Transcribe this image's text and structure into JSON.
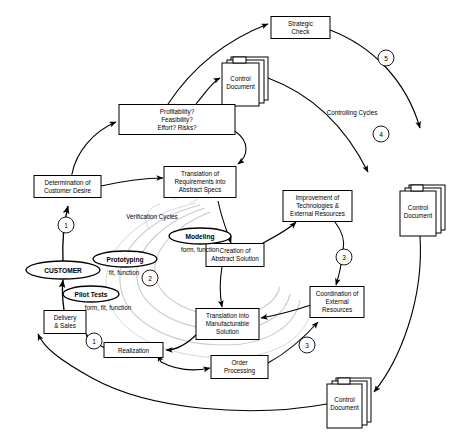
{
  "diagram": {
    "nodes": {
      "strategic_check": {
        "line1": "Strategic",
        "line2": "Check"
      },
      "control_document_top": {
        "line1": "Control",
        "line2": "Document"
      },
      "control_document_right": {
        "line1": "Control",
        "line2": "Document"
      },
      "control_document_bottom": {
        "line1": "Control",
        "line2": "Document"
      },
      "profitability": {
        "line1": "Profitability?",
        "line2": "Feasibility?",
        "line3": "Effort? Risks?"
      },
      "determination": {
        "line1": "Determination of",
        "line2": "Customer Desire"
      },
      "translation_requirements": {
        "line1": "Translation of",
        "line2": "Requirements into",
        "line3": "Abstract Specs"
      },
      "improvement": {
        "line1": "Improvement of",
        "line2": "Technologies &",
        "line3": "External Resources"
      },
      "creation_abstract": {
        "line1": "Creation of",
        "line2": "Abstract Solution"
      },
      "coordination": {
        "line1": "Coordination of",
        "line2": "External",
        "line3": "Resources"
      },
      "translation_manufacturable": {
        "line1": "Translation into",
        "line2": "Manufacturable",
        "line3": "Solution"
      },
      "order_processing": {
        "line1": "Order",
        "line2": "Processing"
      },
      "realization": {
        "line1": "Realization"
      },
      "delivery_sales": {
        "line1": "Delivery",
        "line2": "& Sales"
      },
      "customer": {
        "label": "CUSTOMER"
      },
      "modeling": {
        "label": "Modeling",
        "sub": "form, function"
      },
      "prototyping": {
        "label": "Prototyping",
        "sub": "fit, function"
      },
      "pilot_tests": {
        "label": "Pilot Tests",
        "sub": "form, fit, function"
      }
    },
    "labels": {
      "verification_cycles": "Verification Cycles",
      "controlling_cycles": "Controlling Cycles"
    },
    "cycle_markers": {
      "m1_top": "1",
      "m1_bottom": "1",
      "m2": "2",
      "m3_upper": "3",
      "m3_lower": "3",
      "m4": "4",
      "m5": "5"
    }
  }
}
